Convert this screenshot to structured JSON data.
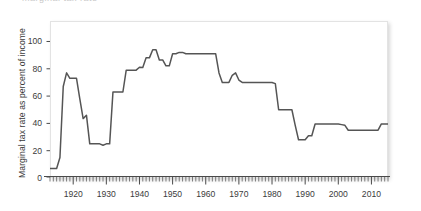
{
  "figure": {
    "title_fragment": "marginal tax rate",
    "line_color": "#555555",
    "axis_color": "#4a4a4a",
    "text_color": "#3b3b3b",
    "plot_background": "#ffffff",
    "plot_border_color": "#e3e3e3"
  },
  "chart_data": {
    "type": "line",
    "title": "",
    "subtitle": "",
    "xlabel": "",
    "ylabel": "Marginal tax rate as percent of income",
    "xlim": [
      1913,
      2015
    ],
    "ylim": [
      0,
      115
    ],
    "grid": false,
    "legend": null,
    "y_ticks": [
      0,
      20,
      40,
      60,
      80,
      100
    ],
    "y_tick_labels": [
      "0",
      "20",
      "40",
      "60",
      "80",
      "100"
    ],
    "x_ticks": [
      1920,
      1930,
      1940,
      1950,
      1960,
      1970,
      1980,
      1990,
      2000,
      2010
    ],
    "x_tick_labels": [
      "1920",
      "1930",
      "1940",
      "1950",
      "1960",
      "1970",
      "1980",
      "1990",
      "2000",
      "2010"
    ],
    "x_minor_tick_interval": 1,
    "series": [
      {
        "name": "Top marginal tax rate",
        "color": "#555555",
        "x": [
          1913,
          1914,
          1915,
          1916,
          1917,
          1918,
          1919,
          1920,
          1921,
          1922,
          1923,
          1924,
          1925,
          1926,
          1927,
          1928,
          1929,
          1930,
          1931,
          1932,
          1933,
          1934,
          1935,
          1936,
          1937,
          1938,
          1939,
          1940,
          1941,
          1942,
          1943,
          1944,
          1945,
          1946,
          1947,
          1948,
          1949,
          1950,
          1951,
          1952,
          1953,
          1954,
          1955,
          1956,
          1957,
          1958,
          1959,
          1960,
          1961,
          1962,
          1963,
          1964,
          1965,
          1966,
          1967,
          1968,
          1969,
          1970,
          1971,
          1972,
          1973,
          1974,
          1975,
          1976,
          1977,
          1978,
          1979,
          1980,
          1981,
          1982,
          1983,
          1984,
          1985,
          1986,
          1987,
          1988,
          1989,
          1990,
          1991,
          1992,
          1993,
          1994,
          1995,
          1996,
          1997,
          1998,
          1999,
          2000,
          2001,
          2002,
          2003,
          2004,
          2005,
          2006,
          2007,
          2008,
          2009,
          2010,
          2011,
          2012,
          2013,
          2014,
          2015
        ],
        "values": [
          7,
          7,
          7,
          15,
          67,
          77,
          73,
          73,
          73,
          58,
          43.5,
          46,
          25,
          25,
          25,
          25,
          24,
          25,
          25,
          63,
          63,
          63,
          63,
          79,
          79,
          79,
          79,
          81.1,
          81,
          88,
          88,
          94,
          94,
          86.45,
          86.45,
          82.13,
          82.13,
          91,
          91,
          92,
          92,
          91,
          91,
          91,
          91,
          91,
          91,
          91,
          91,
          91,
          91,
          77,
          70,
          70,
          70,
          75.25,
          77,
          71.75,
          70,
          70,
          70,
          70,
          70,
          70,
          70,
          70,
          70,
          70,
          69.125,
          50,
          50,
          50,
          50,
          50,
          38.5,
          28,
          28,
          28,
          31,
          31,
          39.6,
          39.6,
          39.6,
          39.6,
          39.6,
          39.6,
          39.6,
          39.6,
          39.1,
          38.6,
          35,
          35,
          35,
          35,
          35,
          35,
          35,
          35,
          35,
          35,
          39.6,
          39.6,
          39.6
        ]
      }
    ],
    "annotations": []
  }
}
